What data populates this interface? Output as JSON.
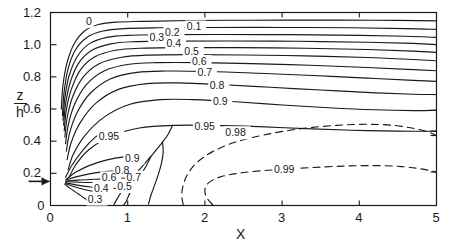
{
  "chart_data": {
    "type": "line",
    "title": "",
    "xlabel": "X",
    "ylabel": "z/h",
    "ylabel_numerator": "z",
    "ylabel_denominator": "h",
    "xlim": [
      0,
      5
    ],
    "ylim": [
      0,
      1.2
    ],
    "grid": false,
    "legend": "none",
    "x_ticks": [
      "0",
      "1",
      "2",
      "3",
      "4",
      "5"
    ],
    "x_tick_values": [
      0,
      1,
      2,
      3,
      4,
      5
    ],
    "y_ticks": [
      "0",
      "0.2",
      "0.4",
      "0.6",
      "0.8",
      "1.0",
      "1.2"
    ],
    "y_tick_values": [
      0,
      0.2,
      0.4,
      0.6,
      0.8,
      1.0,
      1.2
    ],
    "annotations": [
      {
        "name": "y-axis-arrow-marker",
        "x": 0,
        "y": 0.15,
        "text": ""
      }
    ],
    "contours": [
      {
        "level": "0",
        "label": "0",
        "style": "solid",
        "label_x": 0.5,
        "label_y": 1.145,
        "points": [
          [
            0.14,
            0.6
          ],
          [
            0.16,
            0.74
          ],
          [
            0.21,
            0.88
          ],
          [
            0.3,
            1.0
          ],
          [
            0.44,
            1.085
          ],
          [
            0.62,
            1.125
          ],
          [
            0.85,
            1.14
          ],
          [
            1.2,
            1.145
          ],
          [
            1.8,
            1.15
          ],
          [
            2.6,
            1.152
          ],
          [
            3.4,
            1.153
          ],
          [
            4.2,
            1.152
          ],
          [
            5.0,
            1.148
          ]
        ]
      },
      {
        "level": "0.1",
        "label": "0.1",
        "style": "solid",
        "label_x": 1.88,
        "label_y": 1.11,
        "points": [
          [
            0.155,
            0.56
          ],
          [
            0.175,
            0.7
          ],
          [
            0.225,
            0.845
          ],
          [
            0.32,
            0.965
          ],
          [
            0.47,
            1.045
          ],
          [
            0.68,
            1.085
          ],
          [
            0.95,
            1.1
          ],
          [
            1.4,
            1.105
          ],
          [
            2.1,
            1.107
          ],
          [
            3.0,
            1.107
          ],
          [
            3.9,
            1.105
          ],
          [
            4.6,
            1.1
          ],
          [
            5.0,
            1.095
          ]
        ]
      },
      {
        "level": "0.2",
        "label": "0.2",
        "style": "solid",
        "label_x": 1.6,
        "label_y": 1.075,
        "points": [
          [
            0.162,
            0.53
          ],
          [
            0.185,
            0.665
          ],
          [
            0.24,
            0.805
          ],
          [
            0.345,
            0.925
          ],
          [
            0.5,
            1.005
          ],
          [
            0.73,
            1.045
          ],
          [
            1.0,
            1.058
          ],
          [
            1.5,
            1.062
          ],
          [
            2.2,
            1.063
          ],
          [
            3.1,
            1.062
          ],
          [
            4.0,
            1.058
          ],
          [
            4.6,
            1.052
          ],
          [
            5.0,
            1.045
          ]
        ]
      },
      {
        "level": "0.3",
        "label": "0.3",
        "style": "solid",
        "label_x": 1.4,
        "label_y": 1.045,
        "points": [
          [
            0.17,
            0.5
          ],
          [
            0.195,
            0.63
          ],
          [
            0.255,
            0.765
          ],
          [
            0.365,
            0.885
          ],
          [
            0.535,
            0.965
          ],
          [
            0.78,
            1.005
          ],
          [
            1.05,
            1.018
          ],
          [
            1.55,
            1.022
          ],
          [
            2.3,
            1.023
          ],
          [
            3.2,
            1.021
          ],
          [
            4.1,
            1.015
          ],
          [
            4.7,
            1.008
          ],
          [
            5.0,
            1.0
          ]
        ]
      },
      {
        "level": "0.4",
        "label": "0.4",
        "style": "solid",
        "label_x": 1.62,
        "label_y": 1.005,
        "points": [
          [
            0.178,
            0.465
          ],
          [
            0.205,
            0.595
          ],
          [
            0.272,
            0.725
          ],
          [
            0.39,
            0.845
          ],
          [
            0.575,
            0.925
          ],
          [
            0.84,
            0.965
          ],
          [
            1.15,
            0.978
          ],
          [
            1.7,
            0.982
          ],
          [
            2.4,
            0.982
          ],
          [
            3.3,
            0.978
          ],
          [
            4.1,
            0.97
          ],
          [
            4.7,
            0.96
          ],
          [
            5.0,
            0.952
          ]
        ]
      },
      {
        "level": "0.5",
        "label": "0.5",
        "style": "solid",
        "label_x": 1.85,
        "label_y": 0.955,
        "points": [
          [
            0.186,
            0.425
          ],
          [
            0.218,
            0.552
          ],
          [
            0.292,
            0.682
          ],
          [
            0.425,
            0.8
          ],
          [
            0.63,
            0.882
          ],
          [
            0.92,
            0.922
          ],
          [
            1.25,
            0.935
          ],
          [
            1.8,
            0.938
          ],
          [
            2.5,
            0.936
          ],
          [
            3.3,
            0.93
          ],
          [
            4.1,
            0.92
          ],
          [
            4.7,
            0.908
          ],
          [
            5.0,
            0.9
          ]
        ]
      },
      {
        "level": "0.6",
        "label": "0.6",
        "style": "solid",
        "label_x": 1.95,
        "label_y": 0.895,
        "points": [
          [
            0.195,
            0.385
          ],
          [
            0.232,
            0.505
          ],
          [
            0.315,
            0.632
          ],
          [
            0.465,
            0.752
          ],
          [
            0.7,
            0.838
          ],
          [
            1.02,
            0.878
          ],
          [
            1.38,
            0.888
          ],
          [
            1.95,
            0.888
          ],
          [
            2.6,
            0.882
          ],
          [
            3.35,
            0.872
          ],
          [
            4.1,
            0.858
          ],
          [
            4.7,
            0.845
          ],
          [
            5.0,
            0.838
          ]
        ]
      },
      {
        "level": "0.7",
        "label": "0.7",
        "style": "solid",
        "label_x": 2.02,
        "label_y": 0.825,
        "points": [
          [
            0.205,
            0.338
          ],
          [
            0.248,
            0.452
          ],
          [
            0.345,
            0.578
          ],
          [
            0.515,
            0.698
          ],
          [
            0.78,
            0.788
          ],
          [
            1.12,
            0.828
          ],
          [
            1.5,
            0.836
          ],
          [
            2.05,
            0.833
          ],
          [
            2.7,
            0.822
          ],
          [
            3.4,
            0.808
          ],
          [
            4.1,
            0.792
          ],
          [
            4.7,
            0.778
          ],
          [
            5.0,
            0.772
          ]
        ]
      },
      {
        "level": "0.8",
        "label": "0.8",
        "style": "solid",
        "label_x": 2.18,
        "label_y": 0.748,
        "points": [
          [
            0.215,
            0.285
          ],
          [
            0.268,
            0.392
          ],
          [
            0.385,
            0.515
          ],
          [
            0.585,
            0.635
          ],
          [
            0.88,
            0.722
          ],
          [
            1.25,
            0.758
          ],
          [
            1.65,
            0.762
          ],
          [
            2.2,
            0.752
          ],
          [
            2.85,
            0.735
          ],
          [
            3.5,
            0.718
          ],
          [
            4.15,
            0.702
          ],
          [
            4.7,
            0.692
          ],
          [
            5.0,
            0.69
          ]
        ]
      },
      {
        "level": "0.9",
        "label": "0.9",
        "style": "solid",
        "label_x": 2.22,
        "label_y": 0.648,
        "points": [
          [
            0.228,
            0.222
          ],
          [
            0.295,
            0.318
          ],
          [
            0.44,
            0.432
          ],
          [
            0.69,
            0.548
          ],
          [
            1.02,
            0.628
          ],
          [
            1.42,
            0.658
          ],
          [
            1.85,
            0.658
          ],
          [
            2.4,
            0.645
          ],
          [
            3.0,
            0.625
          ],
          [
            3.6,
            0.608
          ],
          [
            4.2,
            0.595
          ],
          [
            4.7,
            0.59
          ],
          [
            5.0,
            0.592
          ]
        ]
      },
      {
        "level": "0.95-upper",
        "label": "0.95",
        "style": "solid",
        "label_x": 2.02,
        "label_y": 0.492,
        "points": [
          [
            0.24,
            0.175
          ],
          [
            0.33,
            0.255
          ],
          [
            0.5,
            0.348
          ],
          [
            0.8,
            0.435
          ],
          [
            1.15,
            0.482
          ],
          [
            1.6,
            0.498
          ],
          [
            2.1,
            0.498
          ],
          [
            2.7,
            0.49
          ],
          [
            3.3,
            0.478
          ],
          [
            3.9,
            0.468
          ],
          [
            4.5,
            0.462
          ],
          [
            5.0,
            0.462
          ]
        ]
      },
      {
        "level": "0.95-lower",
        "label": "0.95",
        "style": "solid",
        "label_x": 0.78,
        "label_y": 0.428,
        "points": [
          [
            0.195,
            0.175
          ],
          [
            0.28,
            0.252
          ],
          [
            0.42,
            0.345
          ],
          [
            0.58,
            0.425
          ],
          [
            0.7,
            0.462
          ]
        ]
      },
      {
        "level": "0.9-lower",
        "label": "0.9",
        "style": "solid",
        "label_x": 1.08,
        "label_y": 0.295,
        "points": [
          [
            0.205,
            0.163
          ],
          [
            0.32,
            0.205
          ],
          [
            0.5,
            0.248
          ],
          [
            0.72,
            0.282
          ],
          [
            0.95,
            0.302
          ],
          [
            1.18,
            0.305
          ]
        ]
      },
      {
        "level": "0.8-lower",
        "label": "0.8",
        "style": "solid",
        "label_x": 0.95,
        "label_y": 0.215,
        "points": [
          [
            0.2,
            0.158
          ],
          [
            0.33,
            0.178
          ],
          [
            0.52,
            0.198
          ],
          [
            0.74,
            0.212
          ],
          [
            0.93,
            0.218
          ]
        ]
      },
      {
        "level": "0.7-lower",
        "label": "0.7",
        "style": "solid",
        "label_x": 1.1,
        "label_y": 0.175,
        "points": [
          [
            0.2,
            0.152
          ],
          [
            0.36,
            0.158
          ],
          [
            0.58,
            0.163
          ],
          [
            0.82,
            0.168
          ],
          [
            1.02,
            0.172
          ]
        ]
      },
      {
        "level": "0.6-lower",
        "label": "0.6",
        "style": "solid",
        "label_x": 0.78,
        "label_y": 0.172,
        "points": [
          [
            0.198,
            0.148
          ],
          [
            0.34,
            0.145
          ],
          [
            0.52,
            0.143
          ],
          [
            0.68,
            0.145
          ]
        ]
      },
      {
        "level": "0.5-lower",
        "label": "0.5",
        "style": "solid",
        "label_x": 0.98,
        "label_y": 0.118,
        "points": [
          [
            0.195,
            0.142
          ],
          [
            0.33,
            0.128
          ],
          [
            0.52,
            0.115
          ],
          [
            0.72,
            0.108
          ],
          [
            0.9,
            0.105
          ]
        ]
      },
      {
        "level": "0.4-lower",
        "label": "0.4",
        "style": "solid",
        "label_x": 0.68,
        "label_y": 0.108,
        "points": [
          [
            0.19,
            0.138
          ],
          [
            0.3,
            0.118
          ],
          [
            0.45,
            0.098
          ],
          [
            0.6,
            0.085
          ],
          [
            0.72,
            0.08
          ]
        ]
      },
      {
        "level": "0.3-lower",
        "label": "0.3",
        "style": "solid",
        "label_x": 0.6,
        "label_y": 0.04,
        "points": [
          [
            0.185,
            0.132
          ],
          [
            0.26,
            0.105
          ],
          [
            0.36,
            0.072
          ],
          [
            0.45,
            0.042
          ],
          [
            0.52,
            0.015
          ]
        ]
      },
      {
        "level": "0.95-descend",
        "label": "",
        "style": "solid",
        "label_x": null,
        "label_y": null,
        "points": [
          [
            1.58,
            0.498
          ],
          [
            1.52,
            0.44
          ],
          [
            1.42,
            0.375
          ],
          [
            1.3,
            0.305
          ],
          [
            1.18,
            0.238
          ],
          [
            1.05,
            0.168
          ],
          [
            0.95,
            0.108
          ],
          [
            0.88,
            0.055
          ],
          [
            0.82,
            0.005
          ]
        ]
      },
      {
        "level": "0.9-descend",
        "label": "",
        "style": "solid",
        "label_x": null,
        "label_y": null,
        "points": [
          [
            1.3,
            0.305
          ],
          [
            1.25,
            0.255
          ],
          [
            1.18,
            0.198
          ],
          [
            1.1,
            0.138
          ],
          [
            1.03,
            0.08
          ],
          [
            0.98,
            0.025
          ],
          [
            0.95,
            0.005
          ]
        ]
      },
      {
        "level": "0.85-descend",
        "label": "",
        "style": "solid",
        "label_x": null,
        "label_y": null,
        "points": [
          [
            1.45,
            0.398
          ],
          [
            1.46,
            0.335
          ],
          [
            1.44,
            0.268
          ],
          [
            1.4,
            0.198
          ],
          [
            1.35,
            0.128
          ],
          [
            1.3,
            0.062
          ],
          [
            1.27,
            0.008
          ]
        ]
      },
      {
        "level": "0.98",
        "label": "0.98",
        "style": "dashed",
        "label_x": 2.42,
        "label_y": 0.452,
        "points": [
          [
            1.72,
            0.005
          ],
          [
            1.7,
            0.062
          ],
          [
            1.72,
            0.128
          ],
          [
            1.78,
            0.198
          ],
          [
            1.9,
            0.268
          ],
          [
            2.1,
            0.335
          ],
          [
            2.4,
            0.395
          ],
          [
            2.8,
            0.442
          ],
          [
            3.25,
            0.478
          ],
          [
            3.7,
            0.498
          ],
          [
            4.1,
            0.505
          ],
          [
            4.45,
            0.498
          ],
          [
            4.72,
            0.478
          ],
          [
            4.9,
            0.455
          ],
          [
            5.0,
            0.435
          ]
        ]
      },
      {
        "level": "0.99",
        "label": "0.99",
        "style": "dashed",
        "label_x": 3.05,
        "label_y": 0.222,
        "points": [
          [
            2.1,
            0.005
          ],
          [
            2.02,
            0.052
          ],
          [
            2.0,
            0.098
          ],
          [
            2.05,
            0.142
          ],
          [
            2.2,
            0.178
          ],
          [
            2.5,
            0.205
          ],
          [
            2.9,
            0.222
          ],
          [
            3.35,
            0.235
          ],
          [
            3.8,
            0.245
          ],
          [
            4.2,
            0.248
          ],
          [
            4.55,
            0.242
          ],
          [
            4.8,
            0.228
          ],
          [
            5.0,
            0.208
          ]
        ]
      }
    ]
  }
}
